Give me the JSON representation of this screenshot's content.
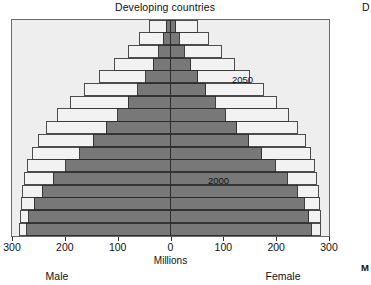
{
  "chart_title": "Developing countries",
  "neighbour": {
    "title_fragment": "D",
    "axis_fragment": "M"
  },
  "axis": {
    "title": "Millions",
    "tick_labels": [
      "300",
      "200",
      "100",
      "0",
      "100",
      "200",
      "300"
    ],
    "tick_values": [
      -300,
      -200,
      -100,
      0,
      100,
      200,
      300
    ],
    "male_label": "Male",
    "female_label": "Female"
  },
  "series_tags": {
    "future": "2050",
    "present": "2000"
  },
  "colors": {
    "plot_background": "#eeeeee",
    "frame": "#6b6b6b",
    "year_2000_fill": "#787878",
    "year_2000_edge": "#2b2b2b",
    "year_2050_fill": "#f2f2f2",
    "year_2050_edge": "#3a3a3a",
    "text": "#111111"
  },
  "chart_data": {
    "type": "bar",
    "subtype": "population-pyramid",
    "title": "Developing countries",
    "xlabel": "Millions",
    "ylabel": "",
    "xlim": [
      -300,
      300
    ],
    "xtick_labels": [
      "300",
      "200",
      "100",
      "0",
      "100",
      "200",
      "300"
    ],
    "grid": false,
    "legend": "in-plot annotations",
    "note": "Horizontal bars mirrored about 0. Left half = Male, right half = Female. Values in millions of people per 5-year age band.",
    "categories": [
      "80+",
      "75-79",
      "70-74",
      "65-69",
      "60-64",
      "55-59",
      "50-54",
      "45-49",
      "40-44",
      "35-39",
      "30-34",
      "25-29",
      "20-24",
      "15-19",
      "10-14",
      "5-9",
      "0-4"
    ],
    "series": [
      {
        "name": "2000",
        "fill": "#787878",
        "male_values": [
          8,
          14,
          22,
          33,
          47,
          62,
          80,
          100,
          122,
          146,
          172,
          198,
          222,
          243,
          258,
          268,
          272
        ],
        "female_values": [
          10,
          17,
          26,
          38,
          52,
          67,
          85,
          104,
          125,
          148,
          173,
          198,
          221,
          240,
          253,
          262,
          266
        ]
      },
      {
        "name": "2050",
        "fill": "#f2f2f2",
        "male_values": [
          40,
          58,
          80,
          106,
          134,
          162,
          190,
          214,
          234,
          250,
          262,
          270,
          276,
          280,
          282,
          284,
          285
        ],
        "female_values": [
          52,
          72,
          96,
          122,
          149,
          176,
          201,
          223,
          241,
          255,
          265,
          272,
          277,
          280,
          282,
          283,
          284
        ]
      }
    ]
  }
}
